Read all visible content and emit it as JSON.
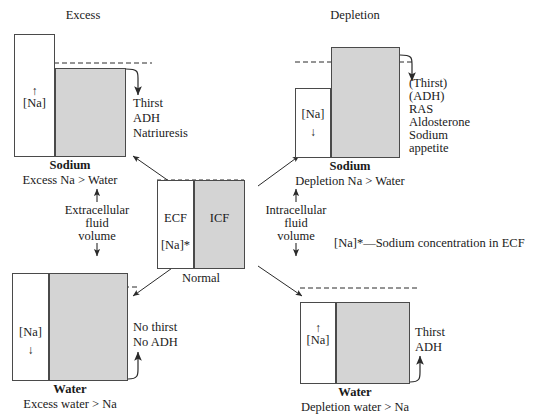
{
  "diagram": {
    "title_left": "Excess",
    "title_right": "Depletion",
    "footnote": "[Na]*—Sodium concentration in ECF"
  },
  "center": {
    "ecf_label": "ECF",
    "icf_label": "ICF",
    "na_star_label": "[Na]*",
    "caption": "Normal"
  },
  "axis_left": {
    "line1": "Extracellular",
    "line2": "fluid",
    "line3": "volume",
    "arrow_up": "↑",
    "arrow_down": "↓"
  },
  "axis_right": {
    "line1": "Intracellular",
    "line2": "fluid",
    "line3": "volume",
    "arrow_up": "↑",
    "arrow_down": "↓"
  },
  "panels": [
    {
      "id": "sodium-excess",
      "position": "top-left",
      "na_label": "[Na]",
      "na_arrow": "↑",
      "bold_caption": "Sodium",
      "sub_caption": "Excess Na > Water",
      "responses": [
        "Thirst",
        "ADH",
        "Natriuresis"
      ]
    },
    {
      "id": "sodium-depletion",
      "position": "top-right",
      "na_label": "[Na]",
      "na_arrow": "↓",
      "bold_caption": "Sodium",
      "sub_caption": "Depletion Na > Water",
      "responses": [
        "(Thirst)",
        "(ADH)",
        "RAS",
        "Aldosterone",
        "Sodium",
        "appetite"
      ]
    },
    {
      "id": "water-excess",
      "position": "bottom-left",
      "na_label": "[Na]",
      "na_arrow": "↓",
      "bold_caption": "Water",
      "sub_caption": "Excess water > Na",
      "responses": [
        "No thirst",
        "No ADH"
      ]
    },
    {
      "id": "water-depletion",
      "position": "bottom-right",
      "na_label": "[Na]",
      "na_arrow": "↑",
      "bold_caption": "Water",
      "sub_caption": "Depletion water > Na",
      "responses": [
        "Thirst",
        "ADH"
      ]
    }
  ],
  "colors": {
    "icf_fill": "#d4d4d4",
    "ecf_fill": "#ffffff",
    "stroke": "#4a4a4a",
    "text": "#1a1a1a"
  }
}
